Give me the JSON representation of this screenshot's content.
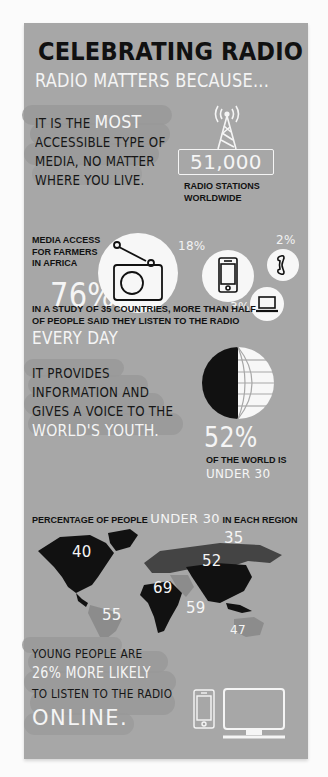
{
  "title": "CELEBRATING RADIO",
  "subtitle": "RADIO MATTERS BECAUSE...",
  "section_accessible": {
    "line1_prefix": "IT IS THE ",
    "line1_highlight": "MOST",
    "line2": "ACCESSIBLE TYPE OF",
    "line3": "MEDIA, NO MATTER",
    "line4": "WHERE YOU LIVE.",
    "stations_count": "51,000",
    "stations_label_1": "RADIO STATIONS",
    "stations_label_2": "WORLDWIDE",
    "tower_icon": "radio-tower-icon"
  },
  "section_farmers": {
    "label_1": "MEDIA ACCESS",
    "label_2": "FOR FARMERS",
    "label_3": "IN AFRICA",
    "items": [
      {
        "name": "Radio",
        "value": "76%",
        "icon": "radio-icon"
      },
      {
        "name": "Mobile phone",
        "value": "18%",
        "icon": "mobile-phone-icon"
      },
      {
        "name": "Telephone",
        "value": "2%",
        "icon": "telephone-icon"
      },
      {
        "name": "Computer",
        "value": "3%",
        "icon": "laptop-icon"
      }
    ]
  },
  "section_study": {
    "line1": "IN A STUDY OF 35 COUNTRIES, MORE THAN HALF",
    "line2": "OF PEOPLE SAID THEY LISTEN TO THE RADIO",
    "highlight": "EVERY DAY"
  },
  "section_youth": {
    "line1": "IT PROVIDES",
    "line2": "INFORMATION AND",
    "line3": "GIVES A VOICE TO THE",
    "highlight": "WORLD'S YOUTH.",
    "percent": "52%",
    "percent_label": "OF THE WORLD IS",
    "percent_highlight": "UNDER 30",
    "globe_icon": "globe-icon"
  },
  "section_map": {
    "heading_prefix": "PERCENTAGE OF PEOPLE ",
    "heading_highlight": "UNDER 30",
    "heading_suffix": " IN EACH REGION",
    "regions": [
      {
        "name": "North America",
        "value": "40"
      },
      {
        "name": "South America",
        "value": "55"
      },
      {
        "name": "Europe/Russia",
        "value": "35"
      },
      {
        "name": "Africa",
        "value": "69"
      },
      {
        "name": "Middle East",
        "value": "59"
      },
      {
        "name": "Asia",
        "value": "52"
      },
      {
        "name": "Oceania",
        "value": "47"
      }
    ]
  },
  "section_online": {
    "line1": "YOUNG PEOPLE ARE",
    "highlight1": "26% MORE LIKELY",
    "line3": "TO LISTEN TO THE RADIO",
    "highlight2": "ONLINE.",
    "icons": [
      "mobile-phone-icon",
      "monitor-icon"
    ]
  },
  "colors": {
    "panel": "#a7a7a7",
    "page": "#fbfbfb",
    "text_dark": "#161616",
    "text_light": "#f5f5f5",
    "brush_stroke": "#999999"
  }
}
